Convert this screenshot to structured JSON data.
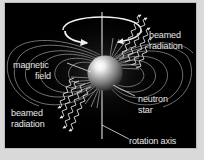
{
  "figure": {
    "background_color": "#d9d9d9",
    "panel_color": "#000000",
    "text_color": "#e9e9e9"
  },
  "labels": {
    "beamed_radiation_top": {
      "line1": "beamed",
      "line2": "radiation"
    },
    "magnetic_field": {
      "line1": "magnetic",
      "line2": "field"
    },
    "beamed_radiation_bottom": {
      "line1": "beamed",
      "line2": "radiation"
    },
    "neutron_star": {
      "line1": "neutron",
      "line2": "star"
    },
    "rotation_axis": {
      "line1": "rotation axis"
    }
  },
  "elements": {
    "neutron_star": {
      "name": "neutron star",
      "shape": "sphere",
      "center_x": 100,
      "center_y": 70,
      "radius": 18,
      "highlight_color": "#ffffff",
      "body_color": "#8a8a8a",
      "shadow_color": "#2b2b2b"
    },
    "rotation_axis": {
      "name": "rotation axis",
      "orientation": "vertical",
      "x": 102,
      "y_top": 12,
      "y_bottom": 139,
      "color": "#e0e0e0"
    },
    "rotation_arrow": {
      "name": "rotation direction arrow",
      "shape": "ellipse with arrowheads",
      "center_x": 102,
      "center_y": 30,
      "rx": 44,
      "ry": 11,
      "color": "#f2f2f2"
    },
    "magnetic_field": {
      "name": "magnetic field lines",
      "type": "dipole loops",
      "loop_count": 10,
      "color": "#9a9a9a"
    },
    "beams": [
      {
        "name": "beamed radiation upper right",
        "direction": "up-right",
        "wave_count": 4,
        "angle_deg": -38
      },
      {
        "name": "beamed radiation lower left",
        "direction": "down-left",
        "wave_count": 4,
        "angle_deg": 142
      }
    ]
  }
}
